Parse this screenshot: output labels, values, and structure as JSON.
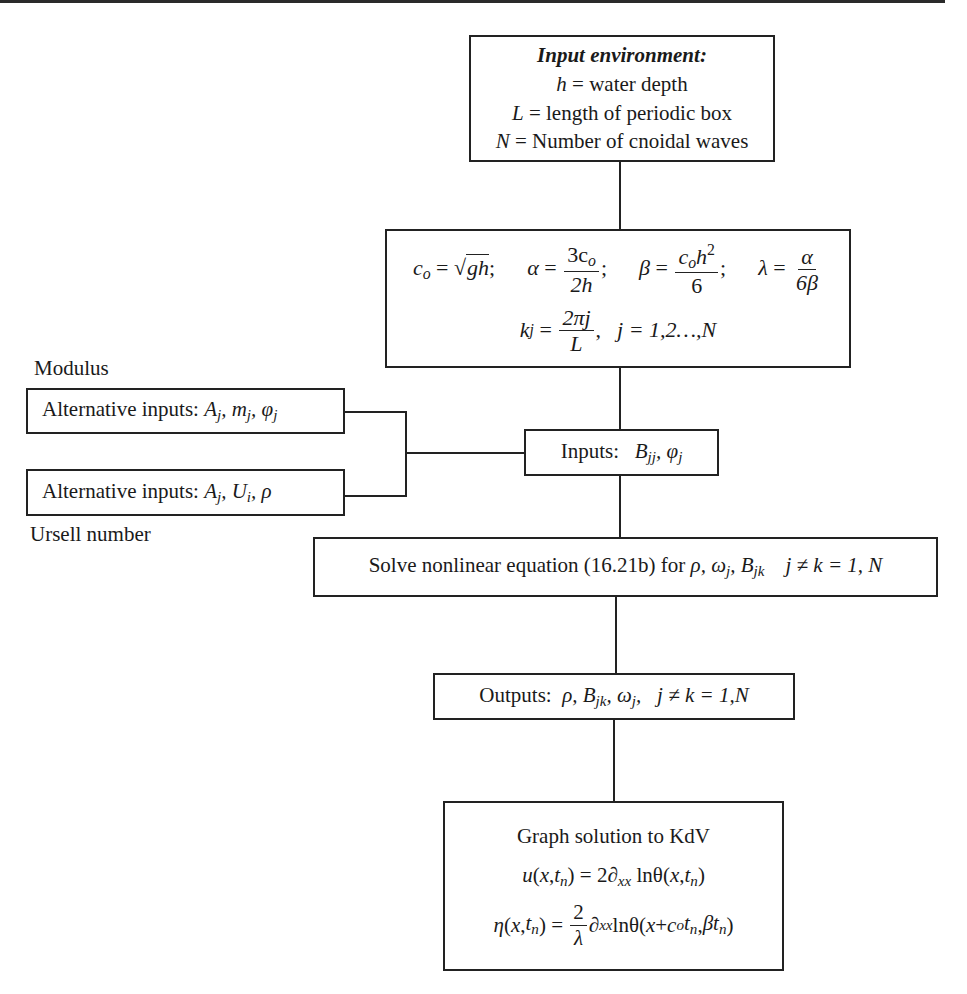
{
  "input_environment": {
    "title": "Input environment:",
    "lines": [
      {
        "symbol": "h",
        "text": " = water depth"
      },
      {
        "symbol": "L",
        "text": " = length of periodic box"
      },
      {
        "symbol": "N",
        "text": " = Number of cnoidal waves"
      }
    ]
  },
  "parameters": {
    "c0": "c",
    "c0_sub": "o",
    "c0_rhs": "gh",
    "alpha_lhs": "α",
    "alpha_num": "3c",
    "alpha_num_sub": "o",
    "alpha_den": "2h",
    "beta_lhs": "β",
    "beta_num": "c",
    "beta_num_sub": "o",
    "beta_num_tail": "h",
    "beta_num_sup": "2",
    "beta_den": "6",
    "lambda_lhs": "λ",
    "lambda_num": "α",
    "lambda_den": "6β",
    "k_lhs": "k",
    "k_sub": "j",
    "k_num": "2πj",
    "k_den": "L",
    "j_range": "j = 1,2…,N"
  },
  "side_labels": {
    "modulus": "Modulus",
    "ursell": "Ursell number"
  },
  "alt_inputs_1": {
    "label": "Alternative inputs: ",
    "vars": "A_j, m_j, φ_j"
  },
  "alt_inputs_2": {
    "label": "Alternative inputs: ",
    "vars": "A_j, U_i, ρ"
  },
  "inputs": {
    "label": "Inputs:",
    "vars": "B_jj, φ_j"
  },
  "solve": {
    "text": "Solve nonlinear equation (16.21b) for ",
    "vars": "ρ, ω_j, B_jk",
    "range": "j ≠ k = 1, N"
  },
  "outputs": {
    "label": "Outputs:",
    "vars": "ρ, B_jk, ω_j,",
    "range": "j ≠ k = 1,N"
  },
  "graph": {
    "title": "Graph solution to KdV",
    "eq1": "u(x,t_n) = 2∂_xx lnθ(x,t_n)",
    "eq2": "η(x,t_n) = (2/λ)∂_xx lnθ(x + c_o t_n, βt_n)"
  }
}
